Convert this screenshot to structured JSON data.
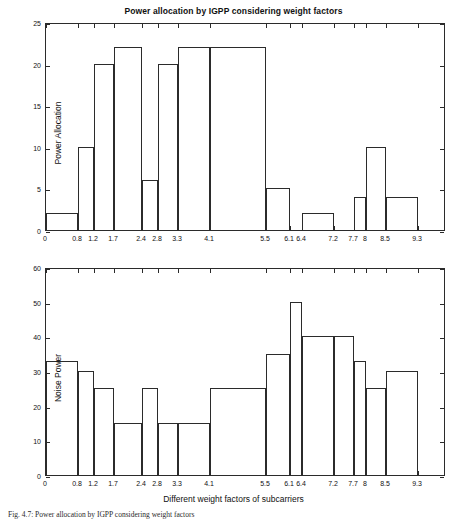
{
  "figure": {
    "caption": "Fig. 4.7: Power allocation by IGPP considering weight factors"
  },
  "chart_data": [
    {
      "type": "bar",
      "id": "power-allocation",
      "title": "Power allocation by IGPP considering weight factors",
      "xlabel": "",
      "ylabel": "Power Allocation",
      "xlim": [
        0,
        10
      ],
      "ylim": [
        0,
        25
      ],
      "yticks": [
        0,
        5,
        10,
        15,
        20,
        25
      ],
      "xticks": [
        0,
        0.8,
        1.2,
        1.7,
        2.4,
        2.8,
        3.3,
        4.1,
        5.5,
        6.1,
        6.4,
        7.2,
        7.7,
        8,
        8.5,
        9.3
      ],
      "xtick_labels": [
        "0",
        "0.8",
        "1.2",
        "1.7",
        "2.4",
        "2.8",
        "3.3",
        "4.1",
        "5.5",
        "6.1",
        "6.4",
        "7.2",
        "7.7",
        "8",
        "8.5",
        "9.3"
      ],
      "ytick_labels": [
        "0",
        "5",
        "10",
        "15",
        "20",
        "25"
      ],
      "grid": false,
      "legend": "none",
      "bin_edges": [
        0,
        0.8,
        1.2,
        1.7,
        2.4,
        2.8,
        3.3,
        4.1,
        5.5,
        6.1,
        6.4,
        7.2,
        7.7,
        8,
        8.5,
        9.3
      ],
      "values": [
        2,
        10,
        20,
        22,
        6,
        20,
        22,
        22,
        5,
        0,
        2,
        0,
        4,
        10,
        4
      ]
    },
    {
      "type": "bar",
      "id": "noise-power",
      "title": "",
      "xlabel": "Different weight factors of subcarriers",
      "ylabel": "Noise Power",
      "xlim": [
        0,
        10
      ],
      "ylim": [
        0,
        60
      ],
      "yticks": [
        0,
        10,
        20,
        30,
        40,
        50,
        60
      ],
      "xticks": [
        0,
        0.8,
        1.2,
        1.7,
        2.4,
        2.8,
        3.3,
        4.1,
        5.5,
        6.1,
        6.4,
        7.2,
        7.7,
        8,
        8.5,
        9.3
      ],
      "xtick_labels": [
        "0",
        "0.8",
        "1.2",
        "1.7",
        "2.4",
        "2.8",
        "3.3",
        "4.1",
        "5.5",
        "6.1",
        "6.4",
        "7.2",
        "7.7",
        "8",
        "8.5",
        "9.3"
      ],
      "ytick_labels": [
        "0",
        "10",
        "20",
        "30",
        "40",
        "50",
        "60"
      ],
      "grid": false,
      "legend": "none",
      "bin_edges": [
        0,
        0.8,
        1.2,
        1.7,
        2.4,
        2.8,
        3.3,
        4.1,
        5.5,
        6.1,
        6.4,
        7.2,
        7.7,
        8,
        8.5,
        9.3
      ],
      "values": [
        33,
        30,
        25,
        15,
        25,
        15,
        15,
        25,
        35,
        50,
        40,
        40,
        33,
        25,
        30
      ]
    }
  ],
  "colors": {
    "axis": "#2b2b2b",
    "bar_stroke": "#2b2b2b",
    "background": "#ffffff",
    "text": "#111111"
  }
}
